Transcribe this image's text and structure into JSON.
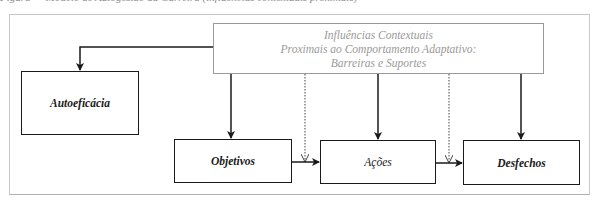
{
  "caption": "Figura — Modelo de Autogestão da Carreira (influências contextuais proximais)",
  "header_box": {
    "lines": [
      "Influências Contextuais",
      "Proximais ao Comportamento Adaptativo:",
      "Barreiras e Suportes"
    ]
  },
  "boxes": {
    "autoeficacia": "Autoeficácia",
    "objetivos": "Objetivos",
    "acoes": "Ações",
    "desfechos": "Desfechos"
  },
  "colors": {
    "main_stroke": "#1a1a1a",
    "header_stroke": "#9a9a9a",
    "frame": "#c8c8c8"
  }
}
